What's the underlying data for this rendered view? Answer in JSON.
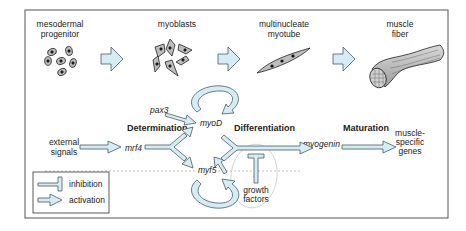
{
  "stages": [
    {
      "label_line1": "mesodermal",
      "label_line2": "progenitor"
    },
    {
      "label_line1": "myoblasts",
      "label_line2": ""
    },
    {
      "label_line1": "multinucleate",
      "label_line2": "myotube"
    },
    {
      "label_line1": "muscle",
      "label_line2": "fiber"
    }
  ],
  "phases": {
    "determination": "Determination",
    "differentiation": "Differentiation",
    "maturation": "Maturation"
  },
  "genes": {
    "pax3": "pax3",
    "mrf4": "mrf4",
    "myoD": "myoD",
    "myf5": "myf5",
    "myogenin": "myogenin"
  },
  "inputs": {
    "external_line1": "external",
    "external_line2": "signals",
    "growth_line1": "growth",
    "growth_line2": "factors"
  },
  "outputs": {
    "line1": "muscle-",
    "line2": "specific",
    "line3": "genes"
  },
  "legend": {
    "inhibition": "inhibition",
    "activation": "activation"
  },
  "colors": {
    "arrow_fill": "#d6ecf5",
    "arrow_stroke": "#4a5a66",
    "cell_fill": "#bdbdbd",
    "frame": "#555555"
  }
}
